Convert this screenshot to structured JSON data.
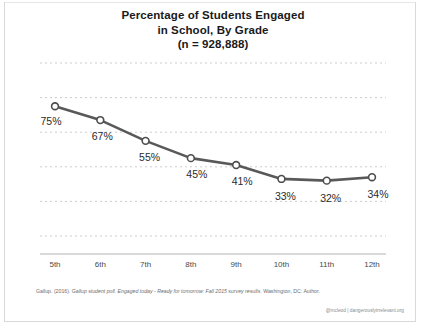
{
  "chart_data": {
    "type": "line",
    "title": "Percentage of Students Engaged in School, By Grade (n = 928,888)",
    "title_lines": [
      "Percentage of Students Engaged",
      "in School, By Grade",
      "(n = 928,888)"
    ],
    "categories": [
      "5th",
      "6th",
      "7th",
      "8th",
      "9th",
      "10th",
      "11th",
      "12th"
    ],
    "values": [
      75,
      67,
      55,
      45,
      41,
      33,
      32,
      34
    ],
    "point_labels": [
      "75%",
      "67%",
      "55%",
      "45%",
      "41%",
      "33%",
      "32%",
      "34%"
    ],
    "xlabel": "",
    "ylabel": "",
    "ylim": [
      0,
      100
    ],
    "grid": "horizontal-dotted",
    "legend": "none",
    "series": [
      {
        "name": "Percentage of Students Engaged",
        "values": [
          75,
          67,
          55,
          45,
          41,
          33,
          32,
          34
        ]
      }
    ],
    "colors": {
      "line": "#595959",
      "marker_fill": "#ffffff",
      "marker_stroke": "#4d4d4d",
      "gridline": "#cccccc",
      "axis": "#b3b3b3",
      "text": "#2b2b2b"
    }
  },
  "source": {
    "citation_prefix": "Gallup. (2016). ",
    "citation_italic": "Gallup student poll. Engaged today - Ready for tomorrow: Fall 2015 survey results.",
    "citation_suffix": " Washington, DC: Author."
  },
  "watermark": {
    "text": "@mcleod | dangerouslyirrelevant.org"
  }
}
